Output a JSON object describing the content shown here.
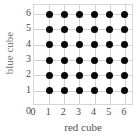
{
  "chart_data": {
    "type": "scatter",
    "title": "",
    "xlabel": "red cube",
    "ylabel": "blue cube",
    "xticks": [
      "0",
      "1",
      "2",
      "3",
      "4",
      "5",
      "6"
    ],
    "yticks": [
      "6",
      "5",
      "4",
      "3",
      "2",
      "1"
    ],
    "ytick_zero": "0",
    "xlim": [
      0,
      6.6
    ],
    "ylim": [
      0,
      6.6
    ],
    "grid": true,
    "legend": null,
    "marker_color": "#080808",
    "grid_color": "#d2d2d2",
    "frame_color": "#d6d6d6",
    "points": [
      {
        "x": 1,
        "y": 1
      },
      {
        "x": 2,
        "y": 1
      },
      {
        "x": 3,
        "y": 1
      },
      {
        "x": 4,
        "y": 1
      },
      {
        "x": 5,
        "y": 1
      },
      {
        "x": 6,
        "y": 1
      },
      {
        "x": 1,
        "y": 2
      },
      {
        "x": 2,
        "y": 2
      },
      {
        "x": 3,
        "y": 2
      },
      {
        "x": 4,
        "y": 2
      },
      {
        "x": 5,
        "y": 2
      },
      {
        "x": 6,
        "y": 2
      },
      {
        "x": 1,
        "y": 3
      },
      {
        "x": 2,
        "y": 3
      },
      {
        "x": 3,
        "y": 3
      },
      {
        "x": 4,
        "y": 3
      },
      {
        "x": 5,
        "y": 3
      },
      {
        "x": 6,
        "y": 3
      },
      {
        "x": 1,
        "y": 4
      },
      {
        "x": 2,
        "y": 4
      },
      {
        "x": 3,
        "y": 4
      },
      {
        "x": 4,
        "y": 4
      },
      {
        "x": 5,
        "y": 4
      },
      {
        "x": 6,
        "y": 4
      },
      {
        "x": 1,
        "y": 5
      },
      {
        "x": 2,
        "y": 5
      },
      {
        "x": 3,
        "y": 5
      },
      {
        "x": 4,
        "y": 5
      },
      {
        "x": 5,
        "y": 5
      },
      {
        "x": 6,
        "y": 5
      },
      {
        "x": 1,
        "y": 6
      },
      {
        "x": 2,
        "y": 6
      },
      {
        "x": 3,
        "y": 6
      },
      {
        "x": 4,
        "y": 6
      },
      {
        "x": 5,
        "y": 6
      },
      {
        "x": 6,
        "y": 6
      }
    ]
  }
}
